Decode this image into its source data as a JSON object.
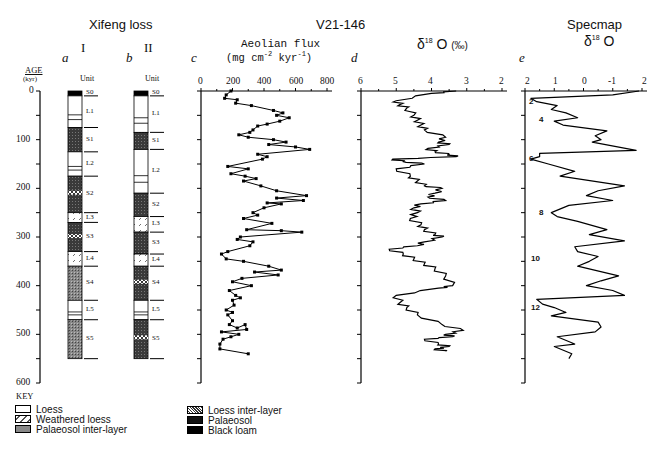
{
  "titles": {
    "xifeng": "Xifeng loss",
    "v21": "V21-146",
    "specmap": "Specmap",
    "specmap_sub": "δ18 O"
  },
  "panels": {
    "a": {
      "letter": "a",
      "roman": "I",
      "unit_label": "Unit"
    },
    "b": {
      "letter": "b",
      "roman": "II",
      "unit_label": "Unit"
    },
    "c": {
      "letter": "c",
      "label_line1": "Aeolian flux",
      "label_line2": "(mg cm⁻² kyr⁻¹)"
    },
    "d": {
      "letter": "d",
      "label": "δ18O (‰)"
    },
    "e": {
      "letter": "e"
    }
  },
  "age_axis": {
    "label": "AGE",
    "unit": "(kyr)",
    "ticks": [
      "0",
      "100",
      "200",
      "300",
      "400",
      "500",
      "600"
    ]
  },
  "key": {
    "title": "KEY",
    "items": [
      {
        "label": "Loess",
        "pattern": "loess"
      },
      {
        "label": "Weathered loess",
        "pattern": "weathered"
      },
      {
        "label": "Palaeosol inter-layer",
        "pattern": "pinter"
      },
      {
        "label": "Loess inter-layer",
        "pattern": "linter"
      },
      {
        "label": "Palaeosol",
        "pattern": "palaeosol"
      },
      {
        "label": "Black loam",
        "pattern": "black"
      }
    ]
  },
  "chart_data": [
    {
      "type": "table",
      "title": "Xifeng loess stratigraphic column I",
      "ylabel": "AGE (kyr)",
      "ylim": [
        0,
        600
      ],
      "units": [
        {
          "name": "S0",
          "top": 0,
          "bottom": 10,
          "type": "black"
        },
        {
          "name": "L1",
          "top": 10,
          "bottom": 75,
          "type": "loess"
        },
        {
          "name": "S1",
          "top": 75,
          "bottom": 125,
          "type": "palaeosol"
        },
        {
          "name": "L2",
          "top": 125,
          "bottom": 175,
          "type": "loess"
        },
        {
          "name": "S2",
          "top": 175,
          "bottom": 250,
          "type": "palaeosol"
        },
        {
          "name": "L3",
          "top": 250,
          "bottom": 270,
          "type": "weathered"
        },
        {
          "name": "S3",
          "top": 270,
          "bottom": 330,
          "type": "palaeosol"
        },
        {
          "name": "L4",
          "top": 330,
          "bottom": 360,
          "type": "weathered"
        },
        {
          "name": "S4",
          "top": 360,
          "bottom": 430,
          "type": "pinter"
        },
        {
          "name": "L5",
          "top": 430,
          "bottom": 470,
          "type": "loess"
        },
        {
          "name": "S5",
          "top": 470,
          "bottom": 550,
          "type": "pinter"
        }
      ]
    },
    {
      "type": "table",
      "title": "Xifeng loess stratigraphic column II",
      "ylabel": "AGE (kyr)",
      "ylim": [
        0,
        600
      ],
      "units": [
        {
          "name": "S0",
          "top": 0,
          "bottom": 10,
          "type": "black"
        },
        {
          "name": "L1",
          "top": 10,
          "bottom": 85,
          "type": "loess"
        },
        {
          "name": "S1",
          "top": 85,
          "bottom": 120,
          "type": "palaeosol"
        },
        {
          "name": "L2",
          "top": 120,
          "bottom": 210,
          "type": "loess"
        },
        {
          "name": "S2",
          "top": 210,
          "bottom": 258,
          "type": "palaeosol"
        },
        {
          "name": "L3",
          "top": 258,
          "bottom": 290,
          "type": "weathered"
        },
        {
          "name": "S3",
          "top": 290,
          "bottom": 335,
          "type": "palaeosol"
        },
        {
          "name": "L4",
          "top": 335,
          "bottom": 360,
          "type": "weathered"
        },
        {
          "name": "S4",
          "top": 360,
          "bottom": 430,
          "type": "palaeosol"
        },
        {
          "name": "L5",
          "top": 430,
          "bottom": 470,
          "type": "loess"
        },
        {
          "name": "S5",
          "top": 470,
          "bottom": 550,
          "type": "palaeosol"
        }
      ]
    },
    {
      "type": "line",
      "title": "Aeolian flux (mg cm-2 kyr-1)",
      "xlabel": "Aeolian flux",
      "ylabel": "AGE (kyr)",
      "xlim": [
        0,
        800
      ],
      "ylim": [
        0,
        600
      ],
      "x_ticks": [
        "0",
        "200",
        "400",
        "600",
        "800"
      ],
      "markers": true,
      "points": [
        [
          190,
          0
        ],
        [
          160,
          8
        ],
        [
          150,
          15
        ],
        [
          230,
          18
        ],
        [
          220,
          25
        ],
        [
          320,
          30
        ],
        [
          460,
          40
        ],
        [
          520,
          45
        ],
        [
          480,
          50
        ],
        [
          560,
          55
        ],
        [
          500,
          62
        ],
        [
          420,
          68
        ],
        [
          360,
          72
        ],
        [
          330,
          80
        ],
        [
          310,
          85
        ],
        [
          240,
          90
        ],
        [
          300,
          95
        ],
        [
          460,
          100
        ],
        [
          540,
          105
        ],
        [
          430,
          110
        ],
        [
          600,
          115
        ],
        [
          690,
          120
        ],
        [
          360,
          130
        ],
        [
          420,
          135
        ],
        [
          390,
          140
        ],
        [
          170,
          155
        ],
        [
          300,
          160
        ],
        [
          190,
          170
        ],
        [
          280,
          175
        ],
        [
          350,
          180
        ],
        [
          270,
          185
        ],
        [
          380,
          195
        ],
        [
          480,
          205
        ],
        [
          670,
          215
        ],
        [
          480,
          220
        ],
        [
          650,
          225
        ],
        [
          420,
          230
        ],
        [
          510,
          232
        ],
        [
          400,
          240
        ],
        [
          330,
          250
        ],
        [
          360,
          255
        ],
        [
          270,
          262
        ],
        [
          450,
          272
        ],
        [
          290,
          285
        ],
        [
          510,
          287
        ],
        [
          640,
          290
        ],
        [
          250,
          300
        ],
        [
          230,
          305
        ],
        [
          330,
          310
        ],
        [
          310,
          318
        ],
        [
          170,
          330
        ],
        [
          130,
          335
        ],
        [
          160,
          345
        ],
        [
          270,
          350
        ],
        [
          430,
          360
        ],
        [
          510,
          368
        ],
        [
          340,
          372
        ],
        [
          490,
          378
        ],
        [
          260,
          385
        ],
        [
          200,
          392
        ],
        [
          320,
          400
        ],
        [
          180,
          410
        ],
        [
          220,
          420
        ],
        [
          250,
          425
        ],
        [
          200,
          430
        ],
        [
          210,
          440
        ],
        [
          160,
          450
        ],
        [
          200,
          455
        ],
        [
          170,
          460
        ],
        [
          200,
          472
        ],
        [
          180,
          480
        ],
        [
          230,
          487
        ],
        [
          280,
          480
        ],
        [
          290,
          490
        ],
        [
          130,
          495
        ],
        [
          240,
          500
        ],
        [
          190,
          505
        ],
        [
          140,
          510
        ],
        [
          120,
          520
        ],
        [
          120,
          530
        ],
        [
          300,
          540
        ]
      ]
    },
    {
      "type": "line",
      "title": "V21-146 δ18O (‰)",
      "xlabel": "δ18O (‰)",
      "ylabel": "AGE (kyr)",
      "xlim": [
        6,
        2
      ],
      "ylim": [
        0,
        600
      ],
      "x_ticks": [
        "6",
        "5",
        "4",
        "3",
        "2"
      ],
      "points": [
        [
          3.3,
          0
        ],
        [
          4.0,
          5
        ],
        [
          5.0,
          20
        ],
        [
          4.9,
          28
        ],
        [
          4.7,
          35
        ],
        [
          4.5,
          50
        ],
        [
          4.4,
          60
        ],
        [
          4.3,
          70
        ],
        [
          4.2,
          80
        ],
        [
          3.6,
          95
        ],
        [
          3.8,
          105
        ],
        [
          3.5,
          110
        ],
        [
          4.1,
          118
        ],
        [
          3.9,
          125
        ],
        [
          3.5,
          130
        ],
        [
          3.3,
          135
        ],
        [
          5.1,
          140
        ],
        [
          4.8,
          145
        ],
        [
          4.2,
          150
        ],
        [
          5.0,
          160
        ],
        [
          4.6,
          175
        ],
        [
          4.4,
          185
        ],
        [
          4.2,
          195
        ],
        [
          3.7,
          200
        ],
        [
          3.9,
          210
        ],
        [
          4.1,
          218
        ],
        [
          3.6,
          225
        ],
        [
          4.3,
          232
        ],
        [
          4.5,
          240
        ],
        [
          4.4,
          250
        ],
        [
          4.6,
          262
        ],
        [
          4.3,
          275
        ],
        [
          4.2,
          285
        ],
        [
          3.9,
          295
        ],
        [
          3.7,
          300
        ],
        [
          4.2,
          310
        ],
        [
          4.4,
          318
        ],
        [
          5.2,
          325
        ],
        [
          4.8,
          335
        ],
        [
          4.5,
          345
        ],
        [
          4.2,
          355
        ],
        [
          3.9,
          365
        ],
        [
          3.6,
          380
        ],
        [
          3.4,
          400
        ],
        [
          3.8,
          405
        ],
        [
          5.0,
          420
        ],
        [
          4.9,
          435
        ],
        [
          4.7,
          445
        ],
        [
          4.4,
          460
        ],
        [
          3.7,
          480
        ],
        [
          3.1,
          492
        ],
        [
          3.6,
          500
        ],
        [
          3.4,
          505
        ],
        [
          4.2,
          510
        ],
        [
          3.8,
          520
        ],
        [
          3.5,
          525
        ],
        [
          3.9,
          530
        ],
        [
          3.6,
          535
        ]
      ]
    },
    {
      "type": "line",
      "title": "Specmap δ18O",
      "xlabel": "δ18O",
      "ylabel": "AGE (kyr)",
      "xlim": [
        2,
        -2
      ],
      "ylim": [
        0,
        600
      ],
      "x_ticks": [
        "2",
        "1",
        "0",
        "-1",
        "2"
      ],
      "stage_labels": [
        {
          "label": "2",
          "age": 22
        },
        {
          "label": "4",
          "age": 60
        },
        {
          "label": "6",
          "age": 140
        },
        {
          "label": "8",
          "age": 250
        },
        {
          "label": "10",
          "age": 345
        },
        {
          "label": "12",
          "age": 445
        }
      ],
      "points": [
        [
          -1.9,
          0
        ],
        [
          -1.0,
          8
        ],
        [
          1.8,
          15
        ],
        [
          1.6,
          22
        ],
        [
          0.9,
          30
        ],
        [
          1.1,
          38
        ],
        [
          0.6,
          45
        ],
        [
          0.2,
          55
        ],
        [
          1.0,
          62
        ],
        [
          0.7,
          70
        ],
        [
          -0.8,
          82
        ],
        [
          -0.4,
          92
        ],
        [
          -0.6,
          100
        ],
        [
          -0.3,
          105
        ],
        [
          -1.8,
          122
        ],
        [
          1.5,
          128
        ],
        [
          1.5,
          135
        ],
        [
          1.8,
          140
        ],
        [
          1.2,
          150
        ],
        [
          0.3,
          165
        ],
        [
          0.8,
          175
        ],
        [
          -1.4,
          195
        ],
        [
          -0.5,
          205
        ],
        [
          -0.1,
          215
        ],
        [
          -1.0,
          225
        ],
        [
          0.5,
          235
        ],
        [
          1.1,
          250
        ],
        [
          0.9,
          258
        ],
        [
          0.2,
          268
        ],
        [
          -0.8,
          285
        ],
        [
          -0.2,
          295
        ],
        [
          -1.4,
          308
        ],
        [
          0.3,
          320
        ],
        [
          0.2,
          330
        ],
        [
          -0.5,
          340
        ],
        [
          -0.2,
          350
        ],
        [
          0.2,
          360
        ],
        [
          -1.2,
          380
        ],
        [
          -0.6,
          390
        ],
        [
          -0.1,
          400
        ],
        [
          -1.0,
          410
        ],
        [
          -1.4,
          420
        ],
        [
          1.6,
          428
        ],
        [
          1.4,
          438
        ],
        [
          1.0,
          445
        ],
        [
          0.6,
          455
        ],
        [
          1.1,
          462
        ],
        [
          -0.5,
          475
        ],
        [
          -0.6,
          485
        ],
        [
          -0.4,
          495
        ],
        [
          0.9,
          505
        ],
        [
          0.3,
          520
        ],
        [
          1.0,
          525
        ],
        [
          0.4,
          540
        ],
        [
          0.5,
          550
        ]
      ]
    }
  ]
}
